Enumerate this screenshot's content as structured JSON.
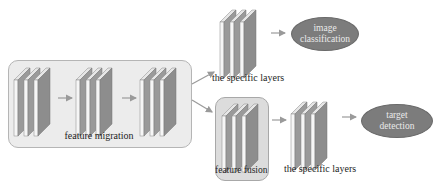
{
  "diagram": {
    "stages": {
      "feature_migration": {
        "label": "feature migration",
        "blocks": 3
      },
      "feature_fusion": {
        "label": "feature fusion",
        "blocks": 1
      }
    },
    "branches": [
      {
        "layers_label": "the specific layers",
        "output_label_line1": "image",
        "output_label_line2": "classification"
      },
      {
        "layers_label": "the specific layers",
        "output_label_line1": "target",
        "output_label_line2": "detection"
      }
    ],
    "colors": {
      "panel_light": "#f4f4f4",
      "panel_mid": "#b9b9b9",
      "panel_dark": "#8a8a8a",
      "ellipse": "#7c7c7c",
      "arrow": "#9a9a9a",
      "group_bg": "#ececec",
      "fusion_bg": "#dcdcdc"
    }
  }
}
